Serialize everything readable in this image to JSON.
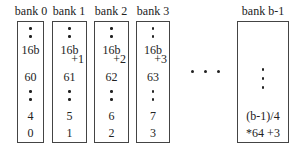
{
  "banks": [
    {
      "label": "bank 0",
      "top": "16b",
      "offset": "",
      "mid": "60",
      "row2": "4",
      "row1": "0"
    },
    {
      "label": "bank 1",
      "top": "16b",
      "offset": "+1",
      "mid": "61",
      "row2": "5",
      "row1": "1"
    },
    {
      "label": "bank 2",
      "top": "16b",
      "offset": "+2",
      "mid": "62",
      "row2": "6",
      "row1": "2"
    },
    {
      "label": "bank 3",
      "top": "16b",
      "offset": "+3",
      "mid": "63",
      "row2": "7",
      "row1": "3"
    }
  ],
  "last_bank": {
    "label": "bank b-1",
    "line1": "(b-1)/4",
    "line2": "*64 +3"
  },
  "ellipsis": "horizontal-dots"
}
